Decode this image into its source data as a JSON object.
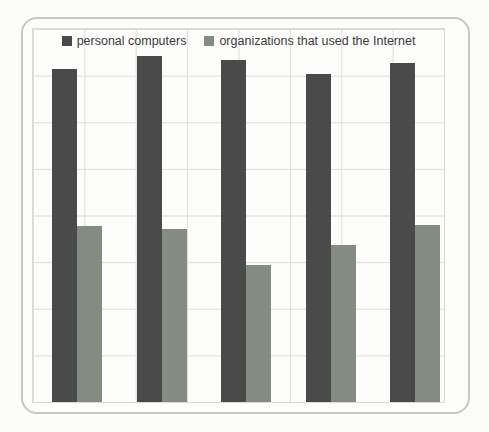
{
  "chart_data": {
    "type": "bar",
    "title": "",
    "xlabel": "",
    "ylabel": "",
    "categories": [
      "",
      "",
      "",
      "",
      ""
    ],
    "series": [
      {
        "name": "personal computers",
        "color": "#4a4a4b",
        "values": [
          89.3,
          92.8,
          91.7,
          87.9,
          90.9
        ]
      },
      {
        "name": "organizations that used the Internet",
        "color": "#848c81",
        "values": [
          47.2,
          46.4,
          36.7,
          42.1,
          47.5
        ]
      }
    ],
    "ylim": [
      0,
      100
    ],
    "value_scale": "percent of plot height (no axis tick labels visible in image)",
    "grid": "on",
    "gridline_color": "#dedddb",
    "legend_position": "top-center",
    "frame_border_color": "#c7c7c4"
  }
}
